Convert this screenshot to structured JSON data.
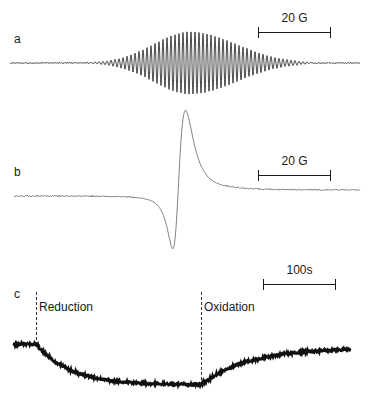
{
  "figure": {
    "background_color": "#ffffff",
    "trace_color": "#1a1a1a"
  },
  "panels": [
    {
      "id": "a",
      "label": "a",
      "label_x": 14,
      "label_y": 33,
      "type": "epr-hyperfine-spectrum",
      "scalebar": {
        "text": "20 G",
        "x": 258,
        "y": 27,
        "width": 73,
        "text_y": 12
      }
    },
    {
      "id": "b",
      "label": "b",
      "label_x": 14,
      "label_y": 166,
      "type": "epr-broad-derivative",
      "scalebar": {
        "text": "20 G",
        "x": 258,
        "y": 170,
        "width": 73,
        "text_y": 155
      }
    },
    {
      "id": "c",
      "label": "c",
      "label_x": 14,
      "label_y": 288,
      "type": "time-course",
      "scalebar": {
        "text": "100s",
        "x": 263,
        "y": 279,
        "width": 73,
        "text_y": 264
      },
      "events": [
        {
          "name": "reduction",
          "label": "Reduction",
          "line_x": 36,
          "line_top": 292,
          "line_bottom": 345,
          "label_x": 39,
          "label_y": 301
        },
        {
          "name": "oxidation",
          "label": "Oxidation",
          "line_x": 201,
          "line_top": 292,
          "line_bottom": 385,
          "label_x": 204,
          "label_y": 301
        }
      ]
    }
  ],
  "chart_data": [
    {
      "type": "line",
      "name": "panel-a-epr-hyperfine",
      "title": "a",
      "xlabel": "",
      "ylabel": "",
      "xlim": [
        10,
        360
      ],
      "ylim": [
        18,
        95
      ],
      "baseline_y": 63,
      "grid": false,
      "description": "Damped oscillatory EPR derivative spectrum with resolved hyperfine structure; about 55 oscillation half-cycles of period 4 px, amplitude envelope peaking near x=190.",
      "scale_annotation": "20 G",
      "envelope": {
        "center": 190,
        "max_amplitude": 31,
        "onset": 100,
        "offset": 300,
        "period_px": 4.0
      }
    },
    {
      "type": "line",
      "name": "panel-b-epr-broad",
      "title": "b",
      "xlabel": "",
      "ylabel": "",
      "xlim": [
        14,
        360
      ],
      "ylim": [
        128,
        242
      ],
      "baseline_left_y": 196,
      "baseline_right_y": 190,
      "grid": false,
      "description": "Single broad first-derivative EPR line; negative trough then positive peak.",
      "scale_annotation": "20 G",
      "features": {
        "trough_x": 170,
        "trough_y": 238,
        "peak_x": 186,
        "peak_y": 131,
        "zero_crossing_x": 178
      }
    },
    {
      "type": "line",
      "name": "panel-c-time-course",
      "title": "c",
      "xlabel": "",
      "ylabel": "",
      "xlim": [
        14,
        350
      ],
      "ylim": [
        340,
        390
      ],
      "grid": false,
      "description": "Noisy kinetic trace: flat baseline, exponential decay after Reduction, plateau, then exponential recovery after Oxidation.",
      "scale_annotation": "100s",
      "features": {
        "baseline_y": 344,
        "reduction_x": 36,
        "plateau_y": 385,
        "oxidation_x": 201,
        "end_x": 350,
        "end_y": 352
      }
    }
  ]
}
